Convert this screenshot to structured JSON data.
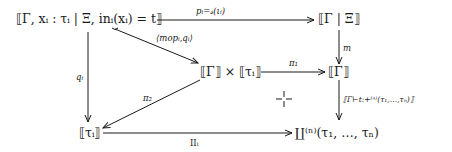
{
  "diagram": {
    "type": "commutative-diagram",
    "nodes": {
      "top_left": "⟦Γ, xᵢ : τᵢ | Ξ, inᵢ(xᵢ) = t⟧",
      "top_right": "⟦Γ | Ξ⟧",
      "middle": "⟦Γ⟧ × ⟦τᵢ⟧",
      "middle_right": "⟦Γ⟧",
      "bottom_left": "⟦τᵢ⟧",
      "bottom_right": "∐⁽ⁿ⁾(τ₁, …, τₙ)"
    },
    "arrows": {
      "top": "pᵢ=𝓈(ιᵢ)",
      "diagonal": "⟨mopᵢ,qᵢ⟩",
      "left_vertical": "qᵢ",
      "right_vertical_m": "m",
      "pi1": "π₁",
      "pi2": "π₂",
      "right_vertical_bottom": "⟦Γ⊢t:+⁽ⁿ⁾(τ₁,…,τₙ)⟧",
      "bottom": "IIᵢ"
    },
    "pullback_marker": "⌐"
  }
}
